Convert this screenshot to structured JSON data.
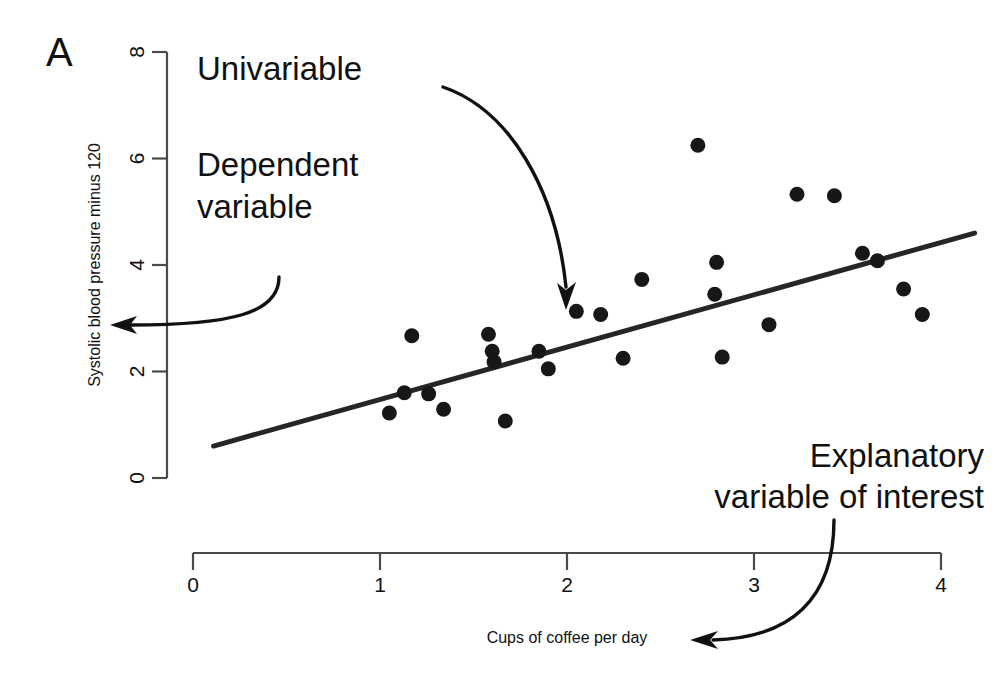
{
  "panel": {
    "label": "A"
  },
  "chart_data": {
    "type": "scatter",
    "title": "",
    "xlabel": "Cups of coffee per day",
    "ylabel": "Systolic blood pressure minus 120",
    "xlim": [
      0,
      4
    ],
    "ylim": [
      0,
      8
    ],
    "xticks": [
      0,
      1,
      2,
      3,
      4
    ],
    "xtick_labels": [
      "0",
      "1",
      "2",
      "3",
      "4"
    ],
    "yticks": [
      0,
      2,
      4,
      6,
      8
    ],
    "ytick_labels": [
      "0",
      "2",
      "4",
      "6",
      "8"
    ],
    "grid": false,
    "legend": null,
    "series": [
      {
        "name": "observations",
        "marker": "filled-circle",
        "color": "#171717",
        "points": [
          {
            "x": 1.05,
            "y": 1.22
          },
          {
            "x": 1.13,
            "y": 1.6
          },
          {
            "x": 1.17,
            "y": 2.67
          },
          {
            "x": 1.26,
            "y": 1.58
          },
          {
            "x": 1.34,
            "y": 1.29
          },
          {
            "x": 1.58,
            "y": 2.7
          },
          {
            "x": 1.6,
            "y": 2.38
          },
          {
            "x": 1.61,
            "y": 2.18
          },
          {
            "x": 1.67,
            "y": 1.07
          },
          {
            "x": 1.85,
            "y": 2.38
          },
          {
            "x": 1.9,
            "y": 2.05
          },
          {
            "x": 2.05,
            "y": 3.13
          },
          {
            "x": 2.18,
            "y": 3.07
          },
          {
            "x": 2.3,
            "y": 2.25
          },
          {
            "x": 2.4,
            "y": 3.73
          },
          {
            "x": 2.7,
            "y": 6.25
          },
          {
            "x": 2.79,
            "y": 3.45
          },
          {
            "x": 2.8,
            "y": 4.05
          },
          {
            "x": 2.83,
            "y": 2.27
          },
          {
            "x": 3.08,
            "y": 2.88
          },
          {
            "x": 3.23,
            "y": 5.33
          },
          {
            "x": 3.43,
            "y": 5.3
          },
          {
            "x": 3.58,
            "y": 4.22
          },
          {
            "x": 3.66,
            "y": 4.08
          },
          {
            "x": 3.8,
            "y": 3.55
          },
          {
            "x": 3.9,
            "y": 3.07
          }
        ]
      },
      {
        "name": "regression-line",
        "type": "line",
        "color": "#262626",
        "endpoints": [
          {
            "x": 0.11,
            "y": 0.6
          },
          {
            "x": 4.18,
            "y": 4.6
          }
        ]
      }
    ]
  },
  "annotations": [
    {
      "id": "univariable",
      "text": "Univariable",
      "points_to": "regression-line"
    },
    {
      "id": "dependent-variable",
      "line1": "Dependent",
      "line2": "variable",
      "points_to": "y-axis"
    },
    {
      "id": "explanatory-variable",
      "line1": "Explanatory",
      "line2": "variable of interest",
      "points_to": "x-axis-title"
    }
  ]
}
